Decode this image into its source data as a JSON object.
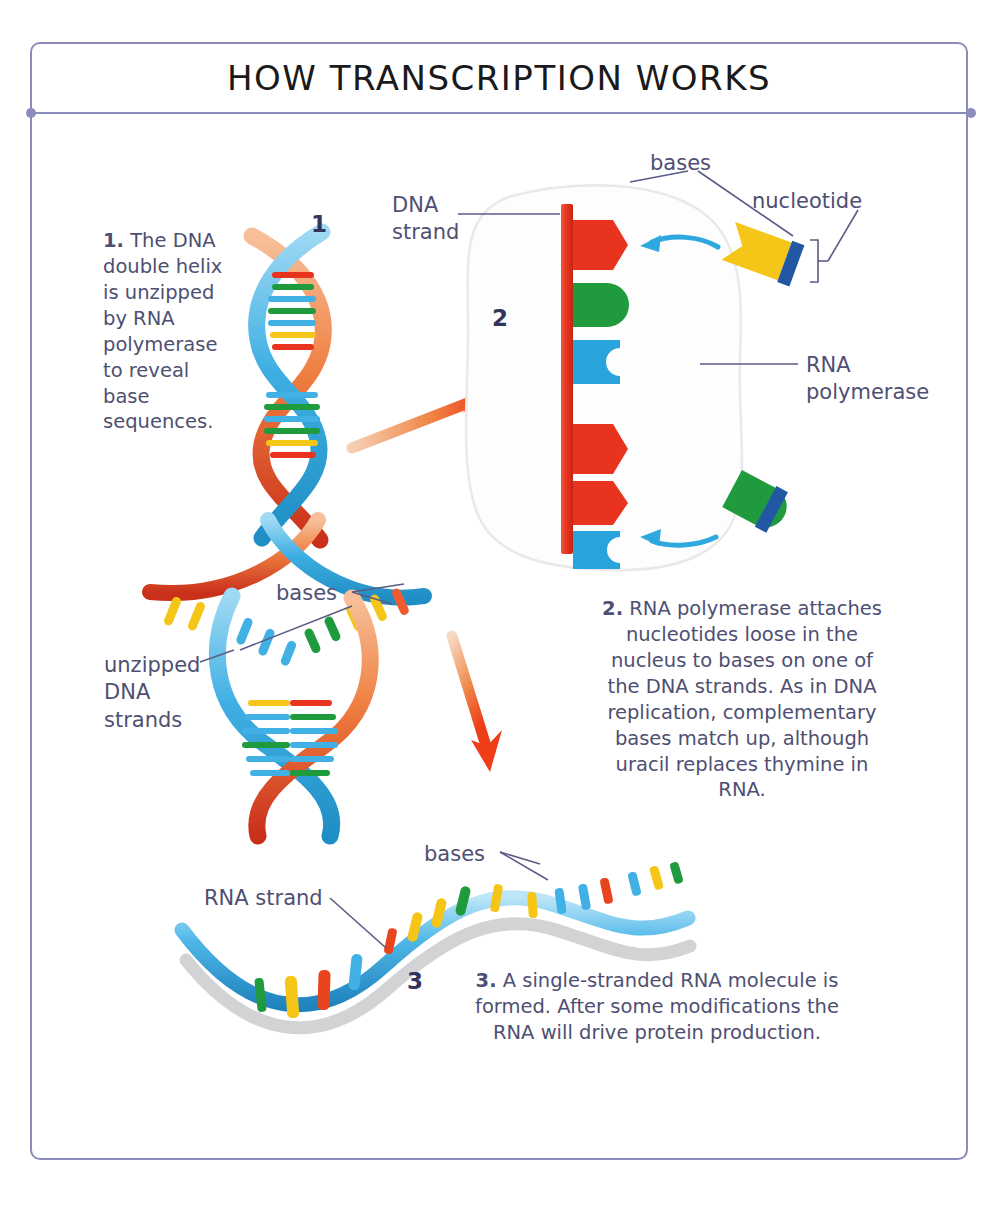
{
  "page": {
    "title": "HOW TRANSCRIPTION WORKS",
    "frame_border_color": "#8b8bbd",
    "text_color": "#4e4f72",
    "number_color": "#33335c",
    "background": "#ffffff"
  },
  "steps": [
    {
      "number": "1",
      "text": "1. The DNA double helix is unzipped by RNA polymerase to reveal base sequences.",
      "bold_prefix": "1.",
      "rest": " The DNA double helix is unzipped by RNA polymerase to reveal base sequences."
    },
    {
      "number": "2",
      "text": "2. RNA polymerase attaches nucleotides loose in the nucleus to bases on one of the DNA strands. As in DNA replication, complementary bases match up, although uracil replaces thymine in RNA.",
      "bold_prefix": "2.",
      "rest": " RNA polymerase attaches nucleotides loose in the nucleus to bases on one of the DNA strands. As in DNA replication, complementary bases match up, although uracil replaces thymine in RNA."
    },
    {
      "number": "3",
      "text": "3. A single-stranded RNA molecule is formed. After some modifications the RNA will drive protein production.",
      "bold_prefix": "3.",
      "rest": " A single-stranded RNA molecule is formed. After some modifications the RNA will drive protein production."
    }
  ],
  "labels": {
    "dna_strand": "DNA\nstrand",
    "bases_top": "bases",
    "nucleotide": "nucleotide",
    "rna_polymerase": "RNA\npolymerase",
    "bases_helix": "bases",
    "unzipped_dna_strands": "unzipped\nDNA\nstrands",
    "bases_rna": "bases",
    "rna_strand": "RNA strand"
  },
  "colors": {
    "base_red": "#e8331e",
    "base_green": "#1f9b3e",
    "base_blue": "#29a3dc",
    "base_yellow": "#f5c518",
    "nucleotide_tail_blue": "#2257a4",
    "strand_blue": "#41b0e4",
    "strand_orange": "#ef7a3c",
    "strand_red": "#d9321c",
    "arrow_orange": "#ef5423",
    "arrow_cyan": "#2fa8e0",
    "leader_line": "#5b5b84",
    "shadow_gray": "#b9bcbe",
    "nucleus_outline": "#e9e9ea"
  },
  "diagram": {
    "type": "biology-process-illustration",
    "panel_1": "DNA double helix unzipping into two strands with colored base rungs",
    "panel_2": "Nucleus interior: vertical red DNA strand with colored bases; free nucleotides approaching",
    "panel_3": "Single-stranded RNA ribbon with colored bases"
  }
}
